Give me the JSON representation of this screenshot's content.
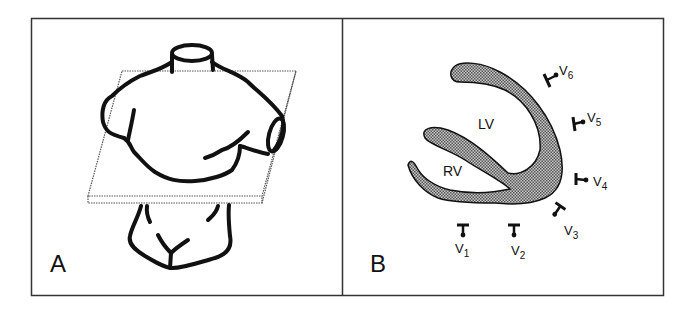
{
  "figure": {
    "panels": [
      {
        "id": "A",
        "label": "A",
        "description": "Torso with transverse plane through chest"
      },
      {
        "id": "B",
        "label": "B",
        "description": "Transverse section of heart with precordial electrodes"
      }
    ],
    "panel_b": {
      "chambers": {
        "lv": "LV",
        "rv": "RV"
      },
      "electrodes": [
        {
          "id": "V1",
          "main": "V",
          "sub": "1"
        },
        {
          "id": "V2",
          "main": "V",
          "sub": "2"
        },
        {
          "id": "V3",
          "main": "V",
          "sub": "3"
        },
        {
          "id": "V4",
          "main": "V",
          "sub": "4"
        },
        {
          "id": "V5",
          "main": "V",
          "sub": "5"
        },
        {
          "id": "V6",
          "main": "V",
          "sub": "6"
        }
      ]
    }
  },
  "colors": {
    "stroke": "#111111",
    "stipple": "#9a9a9a",
    "frame": "#333333"
  }
}
